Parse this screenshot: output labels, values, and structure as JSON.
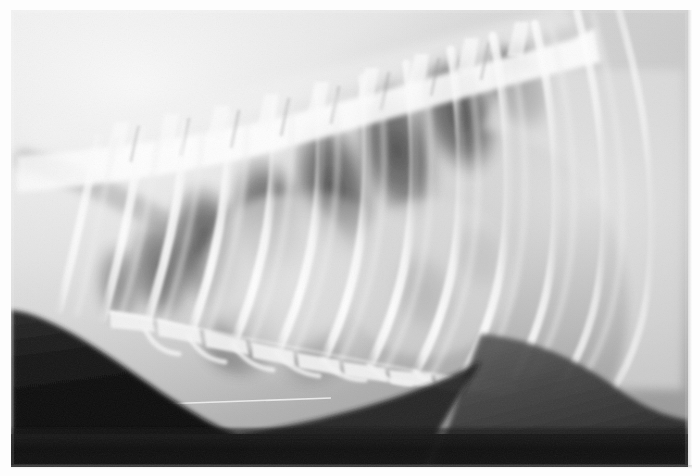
{
  "image": {
    "modality": "radiograph",
    "view": "lateral thoracic",
    "caption_text": "",
    "canvas": {
      "width": 700,
      "height": 476
    },
    "film": {
      "x": 11,
      "y": 10,
      "width": 677,
      "height": 457
    },
    "border_color": "#ffffff",
    "palette": {
      "film_base": "#b9b9b9",
      "soft_tissue_light": "#d8d8d8",
      "lung_field_dark": "#4f4f4f",
      "bone_bright": "#f2f2f2",
      "collimation_black": "#0d0d0d",
      "abdomen_mid": "#3a3a3a",
      "cranial_haze": "#e9e9e9"
    }
  },
  "anatomy": {
    "regions": [
      {
        "name": "thoracic-vertebrae",
        "label": "Thoracic vertebral column",
        "position": "dorsal, spanning cranial to caudal"
      },
      {
        "name": "spinous-processes",
        "label": "Dorsal spinous processes",
        "position": "dorsal margin of vertebrae"
      },
      {
        "name": "rib-cage",
        "label": "Ribs",
        "label_count": 13,
        "position": "arcing ventrally from spine"
      },
      {
        "name": "intercostal-lung-fields",
        "label": "Radiolucent lung fields",
        "position": "between ribs, dorsocaudal"
      },
      {
        "name": "cardiac-silhouette",
        "label": "Cardiac silhouette",
        "position": "central, ventral thorax"
      },
      {
        "name": "sternum",
        "label": "Sternebrae",
        "label_count": 8,
        "position": "ventral chest floor"
      },
      {
        "name": "diaphragm",
        "label": "Diaphragmatic dome",
        "position": "caudal, right of centre"
      },
      {
        "name": "trachea",
        "label": "Tracheal air column",
        "position": "cranioventral, oblique"
      },
      {
        "name": "collimation-edge",
        "label": "Collimation border",
        "position": "ventral and caudal black margin"
      }
    ],
    "rib_arcs": [
      {
        "id": 1,
        "x_top": 96,
        "x_bottom": 52,
        "curve": 0.3
      },
      {
        "id": 2,
        "x_top": 138,
        "x_bottom": 84,
        "curve": 0.33
      },
      {
        "id": 3,
        "x_top": 180,
        "x_bottom": 122,
        "curve": 0.36
      },
      {
        "id": 4,
        "x_top": 222,
        "x_bottom": 162,
        "curve": 0.4
      },
      {
        "id": 5,
        "x_top": 264,
        "x_bottom": 205,
        "curve": 0.44
      },
      {
        "id": 6,
        "x_top": 306,
        "x_bottom": 250,
        "curve": 0.48
      },
      {
        "id": 7,
        "x_top": 348,
        "x_bottom": 298,
        "curve": 0.52
      },
      {
        "id": 8,
        "x_top": 390,
        "x_bottom": 348,
        "curve": 0.56
      },
      {
        "id": 9,
        "x_top": 432,
        "x_bottom": 400,
        "curve": 0.6
      },
      {
        "id": 10,
        "x_top": 472,
        "x_bottom": 452,
        "curve": 0.64
      },
      {
        "id": 11,
        "x_top": 512,
        "x_bottom": 504,
        "curve": 0.68
      },
      {
        "id": 12,
        "x_top": 552,
        "x_bottom": 554,
        "curve": 0.72
      },
      {
        "id": 13,
        "x_top": 592,
        "x_bottom": 600,
        "curve": 0.76
      }
    ],
    "vertebral_bodies": [
      {
        "id": 1,
        "x": 60,
        "y": 118
      },
      {
        "id": 2,
        "x": 108,
        "y": 114
      },
      {
        "id": 3,
        "x": 156,
        "y": 112
      },
      {
        "id": 4,
        "x": 204,
        "y": 110
      },
      {
        "id": 5,
        "x": 252,
        "y": 104
      },
      {
        "id": 6,
        "x": 300,
        "y": 96
      },
      {
        "id": 7,
        "x": 348,
        "y": 86
      },
      {
        "id": 8,
        "x": 396,
        "y": 74
      },
      {
        "id": 9,
        "x": 444,
        "y": 60
      },
      {
        "id": 10,
        "x": 492,
        "y": 46
      }
    ],
    "sternebrae": [
      {
        "id": 1,
        "x": 118,
        "y": 318
      },
      {
        "id": 2,
        "x": 162,
        "y": 330
      },
      {
        "id": 3,
        "x": 208,
        "y": 341
      },
      {
        "id": 4,
        "x": 254,
        "y": 350
      },
      {
        "id": 5,
        "x": 300,
        "y": 357
      },
      {
        "id": 6,
        "x": 346,
        "y": 362
      },
      {
        "id": 7,
        "x": 392,
        "y": 366
      },
      {
        "id": 8,
        "x": 438,
        "y": 368
      }
    ]
  },
  "annotations": {
    "markers": [],
    "text_overlays": []
  }
}
